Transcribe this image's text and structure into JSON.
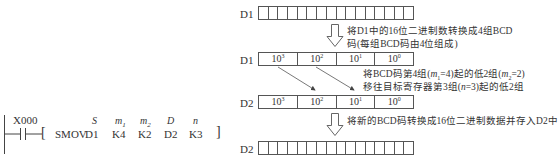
{
  "ladder": {
    "contact": "X000",
    "instruction": "SMOV",
    "operand_names": [
      "S",
      "m1",
      "m2",
      "D",
      "n"
    ],
    "operands": [
      "D1",
      "K4",
      "K2",
      "D2",
      "K3"
    ],
    "open_bracket": "[",
    "close_bracket": "]"
  },
  "diagram": {
    "rows": [
      {
        "label": "D1",
        "type": "bits",
        "cells": 16
      },
      {
        "label": "D1",
        "type": "bcd",
        "digits": [
          {
            "base": "10",
            "exp": "3"
          },
          {
            "base": "10",
            "exp": "2"
          },
          {
            "base": "10",
            "exp": "1"
          },
          {
            "base": "10",
            "exp": "0"
          }
        ]
      },
      {
        "label": "D2",
        "type": "bcd",
        "digits": [
          {
            "base": "10",
            "exp": "3"
          },
          {
            "base": "10",
            "exp": "2"
          },
          {
            "base": "10",
            "exp": "1"
          },
          {
            "base": "10",
            "exp": "0"
          }
        ]
      },
      {
        "label": "D2",
        "type": "bits",
        "cells": 16
      }
    ],
    "notes": {
      "step1_line1": "将D1中的16位二进制数转换成4组BCD",
      "step1_line2": "码(每组BCD码由4位组成)",
      "step2_line1": "将BCD码第4组(m₁=4)起的低2组(m₂=2)",
      "step2_line2": "移往目标寄存器第3组(n=3)起的低2组",
      "step3": "将新的BCD码转换成16位二进制数据并存入D2中"
    }
  }
}
